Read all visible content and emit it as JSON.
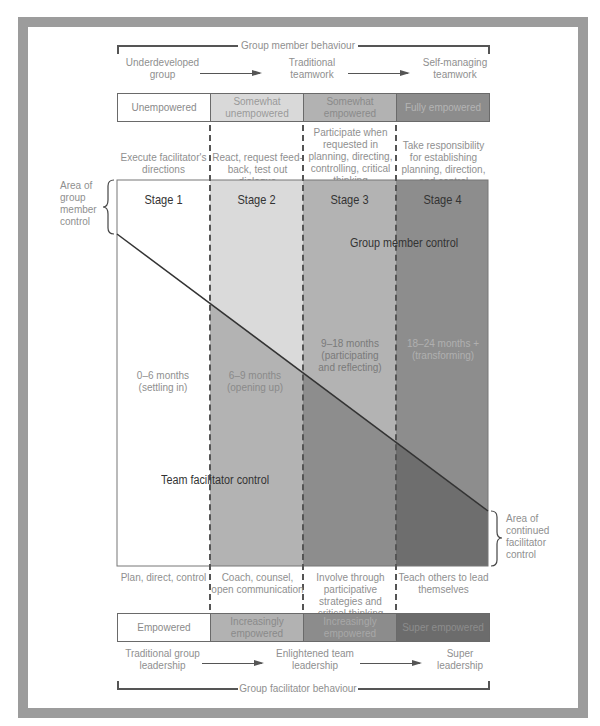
{
  "top": {
    "bracket_label": "Group member behaviour",
    "progression": [
      "Underdeveloped group",
      "Traditional teamwork",
      "Self-managing teamwork"
    ],
    "bar": [
      {
        "label": "Unempowered",
        "color": "#ffffff",
        "text_color": "#8a8a8a"
      },
      {
        "label": "Somewhat unempowered",
        "color": "#d9d9d9",
        "text_color": "#9a9a9a"
      },
      {
        "label": "Somewhat empowered",
        "color": "#b2b2b2",
        "text_color": "#8a8a8a"
      },
      {
        "label": "Fully empowered",
        "color": "#8c8c8c",
        "text_color": "#b4b4b4"
      }
    ],
    "descriptions": [
      "Execute facilitator's directions",
      "React, request feed-back, test out dialogue",
      "Participate when requested in planning, directing, controlling, critical thinking",
      "Take responsibility for establishing planning, direction, and control"
    ]
  },
  "main": {
    "stages": [
      "Stage 1",
      "Stage 2",
      "Stage 3",
      "Stage 4"
    ],
    "durations": [
      "0–6 months (settling in)",
      "6–9 months (opening up)",
      "9–18 months (participating and reflecting)",
      "18–24 months + (transforming)"
    ],
    "upper_label": "Group member control",
    "lower_label": "Team facilitator control",
    "upper_colors": [
      "#ffffff",
      "#dadada",
      "#b3b3b3",
      "#8d8d8d"
    ],
    "lower_colors": [
      "#ffffff",
      "#b3b3b3",
      "#8d8d8d",
      "#6e6e6e"
    ],
    "left_annotation": "Area of group member control",
    "right_annotation": "Area of continued facilitator control"
  },
  "bottom": {
    "descriptions": [
      "Plan, direct, control",
      "Coach, counsel, open communication",
      "Involve through participative strategies and critical thinking",
      "Teach others to lead themselves"
    ],
    "bar": [
      {
        "label": "Empowered",
        "color": "#ffffff",
        "text_color": "#8a8a8a"
      },
      {
        "label": "Increasingly empowered",
        "color": "#b2b2b2",
        "text_color": "#8a8a8a"
      },
      {
        "label": "Increasingly empowered",
        "color": "#8c8c8c",
        "text_color": "#a8a8a8"
      },
      {
        "label": "Super empowered",
        "color": "#6c6c6c",
        "text_color": "#8c8c8c"
      }
    ],
    "progression": [
      "Traditional group leadership",
      "Enlightened team leadership",
      "Super leadership"
    ],
    "bracket_label": "Group facilitator behaviour"
  }
}
